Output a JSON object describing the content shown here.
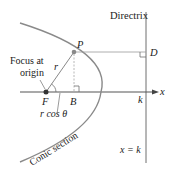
{
  "diagram": {
    "labels": {
      "directrix": "Directrix",
      "point_p": "P",
      "point_d": "D",
      "point_f": "F",
      "point_b": "B",
      "focus_line1": "Focus at",
      "focus_line2": "origin",
      "r": "r",
      "r_cos_theta": "r cos θ",
      "k": "k",
      "x_axis": "x",
      "x_equals_k": "x = k",
      "conic_section": "Conic section"
    },
    "colors": {
      "curve": "#8a8a8a",
      "lines": "#6e6e6e",
      "dashed": "#b0b0b0",
      "text": "#222222",
      "points": "#333333"
    }
  }
}
